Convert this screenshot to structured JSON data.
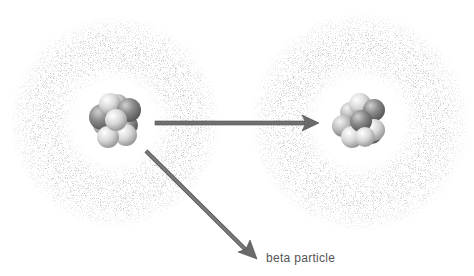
{
  "diagram": {
    "type": "beta-decay",
    "label_beta": "beta particle",
    "atoms": [
      {
        "id": "parent-atom",
        "cx": 115,
        "cy": 122
      },
      {
        "id": "daughter-atom",
        "cx": 360,
        "cy": 122
      }
    ],
    "colors": {
      "arrow": "#6e6e6e",
      "arrow_edge": "#4a4a4a",
      "cloud": "#8a8a8a",
      "text": "#555555",
      "proton": "#7a7a7a",
      "neutron": "#d4d4d4"
    }
  }
}
